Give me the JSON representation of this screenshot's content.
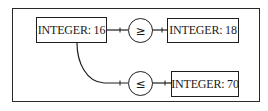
{
  "diagram": {
    "nodes": [
      {
        "id": "n1",
        "label": "INTEGER: 16"
      },
      {
        "id": "n2",
        "label": "INTEGER: 18"
      },
      {
        "id": "n3",
        "label": "INTEGER: 70"
      }
    ],
    "operators": [
      {
        "id": "op1",
        "symbol": "≥",
        "name": "greater-or-equal"
      },
      {
        "id": "op2",
        "symbol": "≤",
        "name": "less-or-equal"
      }
    ],
    "edges": [
      {
        "from": "n1",
        "to": "op1"
      },
      {
        "from": "op1",
        "to": "n2"
      },
      {
        "from": "n1",
        "to": "op2"
      },
      {
        "from": "op2",
        "to": "n3"
      }
    ],
    "colors": {
      "stroke": "#1e1e1e",
      "background": "#ffffff"
    }
  }
}
